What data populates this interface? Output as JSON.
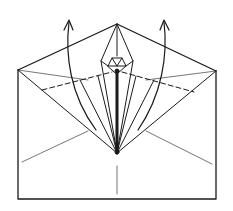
{
  "diagram": {
    "type": "origami-folding-step",
    "colors": {
      "line": "#1a1a1a",
      "background": "#ffffff"
    },
    "elements": {
      "paper_outline": "envelope-rectangle",
      "top_flap": "triangular-flap",
      "center_flap": "narrow-kite-flap",
      "valley_folds": [
        "left-dashed-fold",
        "right-dashed-fold"
      ],
      "arrows": [
        "left-fold-up-arrow",
        "right-fold-up-arrow"
      ]
    }
  }
}
